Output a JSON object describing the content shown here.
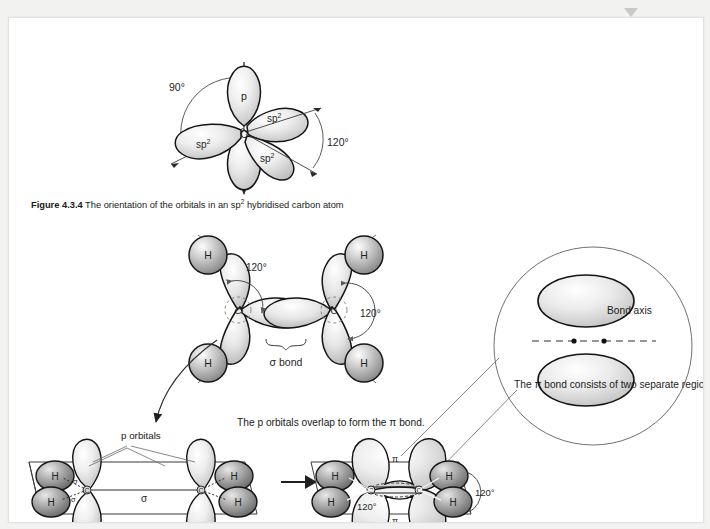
{
  "page": {
    "background_color": "#f2f2f0",
    "paper_color": "#ffffff"
  },
  "scroll_markers": {
    "icon": "chevron-down-triangle",
    "count": 2
  },
  "figure_top": {
    "name": "sp2-hybridised-carbon-orbitals",
    "center_atom": "C",
    "orbital_labels": [
      "p",
      "sp2",
      "sp2",
      "sp2"
    ],
    "p_label": "p",
    "sp2_label": "sp",
    "sp2_superscript": "2",
    "angle_left": "90°",
    "angle_right": "120°"
  },
  "caption": {
    "figure_number": "Figure 4.3.4",
    "text_before": "The orientation of the orbitals in an sp",
    "superscript": "2",
    "text_after": " hybridised carbon atom"
  },
  "figure_ethene_sigma": {
    "name": "ethene-sigma-framework",
    "atom_labels": [
      "H",
      "H",
      "H",
      "H"
    ],
    "carbon_labels": [
      "C",
      "C"
    ],
    "angle_left": "120°",
    "angle_right": "120°",
    "sigma_bond_label": "σ bond"
  },
  "inset_circle": {
    "name": "pi-bond-magnifier",
    "bond_axis_label": "Bond axis",
    "description": "The π bond consists of two separate regions of electron density, on either side of the bond axis."
  },
  "figure_bottom_left": {
    "name": "p-orbitals-before-overlap",
    "p_orbitals_label": "p orbitals",
    "sigma_label": "σ",
    "sigma_small_labels": [
      "σ",
      "σ"
    ],
    "atom_labels": [
      "H",
      "H",
      "H",
      "H"
    ],
    "carbon_labels": [
      "C",
      "C"
    ]
  },
  "transition": {
    "name": "overlap-arrow",
    "caption": "The p orbitals overlap to form the π bond.",
    "arrow": "right-arrow"
  },
  "figure_bottom_right": {
    "name": "pi-bond-formed",
    "pi_labels": [
      "π",
      "π"
    ],
    "atom_labels": [
      "H",
      "H",
      "H",
      "H"
    ],
    "carbon_labels": [
      "C",
      "C"
    ],
    "angle_inner": "120°",
    "angle_outer": "120°"
  },
  "colors": {
    "outline": "#1a1a1a",
    "lobe_light": "#ffffff",
    "lobe_mid": "#dedede",
    "lobe_dark": "#b4b4b4",
    "sphere_dark": "#8e8e8e",
    "leader": "#6e6e6e"
  }
}
